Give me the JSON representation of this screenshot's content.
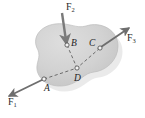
{
  "figure": {
    "background_color": "#ffffff",
    "body": {
      "name": "rigid-body-blob",
      "fill_color": "#cfcfcf",
      "stroke_color": "#b8b8b8",
      "shadow_color": "#e0e0e0"
    },
    "forces": [
      {
        "id": "F1",
        "label": "F",
        "subscript": "1",
        "color": "#6e6e6e",
        "direction": "down-left",
        "tail_point": "A",
        "tail": [
          44,
          79
        ],
        "head": [
          7,
          97
        ]
      },
      {
        "id": "F2",
        "label": "F",
        "subscript": "2",
        "color": "#7a7a7a",
        "direction": "down-right",
        "head_point": "B",
        "tail": [
          62,
          13
        ],
        "head": [
          67,
          45
        ]
      },
      {
        "id": "F3",
        "label": "F",
        "subscript": "3",
        "color": "#6e6e6e",
        "direction": "up-right",
        "tail_point": "C",
        "tail": [
          100,
          48
        ],
        "head": [
          130,
          27
        ]
      }
    ],
    "points": [
      {
        "id": "A",
        "label": "A",
        "x": 44,
        "y": 79,
        "marker": "open-circle"
      },
      {
        "id": "B",
        "label": "B",
        "x": 67,
        "y": 45,
        "marker": "open-circle"
      },
      {
        "id": "C",
        "label": "C",
        "x": 100,
        "y": 48,
        "marker": "open-circle"
      },
      {
        "id": "D",
        "label": "D",
        "x": 77,
        "y": 68,
        "marker": "open-circle"
      }
    ],
    "construction_lines": [
      {
        "id": "line-A-D-C",
        "from": "A",
        "to": "C",
        "via": "D",
        "style": "dashed",
        "color": "#5a5a5a"
      },
      {
        "id": "line-B-D",
        "from": "B",
        "to": "D",
        "style": "dashed",
        "color": "#5a5a5a"
      }
    ]
  }
}
